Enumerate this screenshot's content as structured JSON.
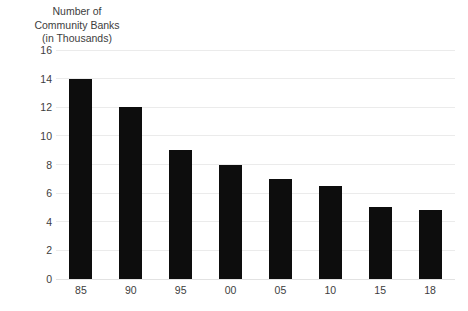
{
  "chart_data": {
    "type": "bar",
    "title": "Number of Community Banks (in Thousands)",
    "title_lines": [
      "Number of",
      "Community Banks",
      "(in Thousands)"
    ],
    "categories": [
      "85",
      "90",
      "95",
      "00",
      "05",
      "10",
      "15",
      "18"
    ],
    "values": [
      14,
      12,
      9,
      8,
      7,
      6.5,
      5,
      4.8
    ],
    "series": [
      {
        "name": "Number of Community Banks",
        "values": [
          14,
          12,
          9,
          8,
          7,
          6.5,
          5,
          4.8
        ]
      }
    ],
    "xlabel": "",
    "ylabel": "Number of Community Banks (in Thousands)",
    "ylim": [
      0,
      16
    ],
    "y_ticks": [
      0,
      2,
      4,
      6,
      8,
      10,
      12,
      14,
      16
    ],
    "y_tick_labels": [
      "0",
      "2",
      "4",
      "6",
      "8",
      "10",
      "12",
      "14",
      "16"
    ],
    "grid": true,
    "grid_axis": "y",
    "legend": false,
    "legend_position": "none",
    "bar_color": "#0d0d0d",
    "grid_color": "#ebebeb",
    "background_color": "#ffffff",
    "text_color": "#3d3d3d"
  }
}
